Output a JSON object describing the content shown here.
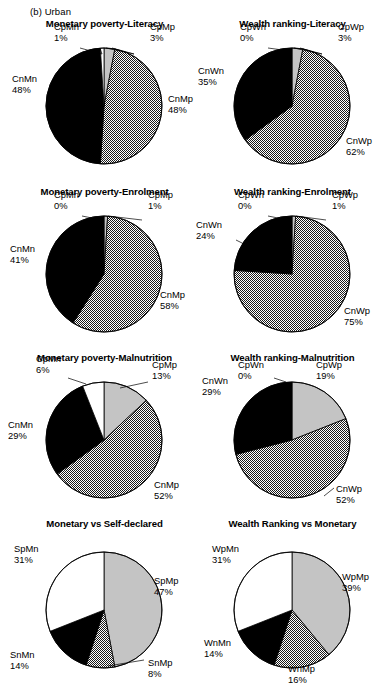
{
  "panel": {
    "label": "(b) Urban"
  },
  "chart_data": [
    {
      "type": "pie",
      "title": "Monetary poverty-Literacy",
      "grid": false,
      "legend": "none",
      "start_angle_deg": 0,
      "direction": "clockwise",
      "cx": 96,
      "cy": 88,
      "r": 58,
      "slices": [
        {
          "name": "CpMp",
          "value": 3,
          "label": "CpMp",
          "value_label": "3%",
          "fill": "gray",
          "lx": 142,
          "ly": 12,
          "anchor": "start",
          "leader": [
            [
              104,
              30
            ],
            [
              126,
              36
            ],
            [
              98,
              30
            ]
          ]
        },
        {
          "name": "CnMp",
          "value": 48,
          "label": "CnMp",
          "value_label": "48%",
          "fill": "dotted",
          "lx": 160,
          "ly": 84,
          "anchor": "start",
          "leader": null
        },
        {
          "name": "CnMn",
          "value": 48,
          "label": "CnMn",
          "value_label": "48%",
          "fill": "black",
          "lx": 4,
          "ly": 64,
          "anchor": "start",
          "leader": null
        },
        {
          "name": "CpMn",
          "value": 1,
          "label": "CpMn",
          "value_label": "1%",
          "fill": "white",
          "lx": 46,
          "ly": 12,
          "anchor": "start",
          "leader": [
            [
              72,
              30
            ],
            [
              94,
              36
            ],
            [
              92,
              30
            ]
          ]
        }
      ]
    },
    {
      "type": "pie",
      "title": "Wealth ranking-Literacy",
      "grid": false,
      "legend": "none",
      "start_angle_deg": 0,
      "direction": "clockwise",
      "cx": 96,
      "cy": 88,
      "r": 58,
      "slices": [
        {
          "name": "CpWp",
          "value": 3,
          "label": "CpWp",
          "value_label": "3%",
          "fill": "gray",
          "lx": 142,
          "ly": 12,
          "anchor": "start",
          "leader": [
            [
              104,
              30
            ],
            [
              126,
              36
            ],
            [
              98,
              30
            ]
          ]
        },
        {
          "name": "CnWp",
          "value": 62,
          "label": "CnWp",
          "value_label": "62%",
          "fill": "dotted",
          "lx": 150,
          "ly": 126,
          "anchor": "start",
          "leader": null
        },
        {
          "name": "CnWn",
          "value": 35,
          "label": "CnWn",
          "value_label": "35%",
          "fill": "black",
          "lx": 2,
          "ly": 56,
          "anchor": "start",
          "leader": [
            [
              44,
              68
            ],
            [
              56,
              74
            ]
          ]
        },
        {
          "name": "CpWn",
          "value": 0,
          "label": "CpWn",
          "value_label": "0%",
          "fill": "white",
          "lx": 44,
          "ly": 12,
          "anchor": "start",
          "leader": [
            [
              72,
              30
            ],
            [
              94,
              33
            ]
          ]
        }
      ]
    },
    {
      "type": "pie",
      "title": "Monetary poverty-Enrolment",
      "grid": false,
      "legend": "none",
      "start_angle_deg": 0,
      "direction": "clockwise",
      "cx": 96,
      "cy": 88,
      "r": 58,
      "slices": [
        {
          "name": "CpMp",
          "value": 1,
          "label": "CpMp",
          "value_label": "1%",
          "fill": "gray",
          "lx": 140,
          "ly": 12,
          "anchor": "start",
          "leader": [
            [
              100,
              30
            ],
            [
              134,
              34
            ]
          ]
        },
        {
          "name": "CnMp",
          "value": 58,
          "label": "CnMp",
          "value_label": "58%",
          "fill": "dotted",
          "lx": 152,
          "ly": 112,
          "anchor": "start",
          "leader": null
        },
        {
          "name": "CnMn",
          "value": 41,
          "label": "CnMn",
          "value_label": "41%",
          "fill": "black",
          "lx": 2,
          "ly": 66,
          "anchor": "start",
          "leader": null
        },
        {
          "name": "CpMn",
          "value": 0,
          "label": "CpMn",
          "value_label": "0%",
          "fill": "white",
          "lx": 46,
          "ly": 12,
          "anchor": "start",
          "leader": [
            [
              74,
              30
            ],
            [
              94,
              34
            ]
          ]
        }
      ]
    },
    {
      "type": "pie",
      "title": "Wealth ranking-Enrolment",
      "grid": false,
      "legend": "none",
      "start_angle_deg": 0,
      "direction": "clockwise",
      "cx": 96,
      "cy": 88,
      "r": 58,
      "slices": [
        {
          "name": "CpWp",
          "value": 1,
          "label": "CpWp",
          "value_label": "1%",
          "fill": "gray",
          "lx": 136,
          "ly": 12,
          "anchor": "start",
          "leader": [
            [
              100,
              30
            ],
            [
              130,
              34
            ]
          ]
        },
        {
          "name": "CnWp",
          "value": 75,
          "label": "CnWp",
          "value_label": "75%",
          "fill": "dotted",
          "lx": 148,
          "ly": 128,
          "anchor": "start",
          "leader": null
        },
        {
          "name": "CnWn",
          "value": 24,
          "label": "CnWn",
          "value_label": "24%",
          "fill": "black",
          "lx": 0,
          "ly": 42,
          "anchor": "start",
          "leader": [
            [
              40,
              54
            ],
            [
              52,
              60
            ]
          ]
        },
        {
          "name": "CpWn",
          "value": 0,
          "label": "CpWn",
          "value_label": "0%",
          "fill": "white",
          "lx": 42,
          "ly": 12,
          "anchor": "start",
          "leader": [
            [
              72,
              30
            ],
            [
              92,
              34
            ]
          ]
        }
      ]
    },
    {
      "type": "pie",
      "title": "Monetary poverty-Malnutrition",
      "grid": false,
      "legend": "none",
      "start_angle_deg": 0,
      "direction": "clockwise",
      "cx": 96,
      "cy": 88,
      "r": 58,
      "slices": [
        {
          "name": "CpMp",
          "value": 13,
          "label": "CpMp",
          "value_label": "13%",
          "fill": "gray",
          "lx": 144,
          "ly": 16,
          "anchor": "start",
          "leader": [
            [
              112,
              36
            ],
            [
              140,
              30
            ]
          ]
        },
        {
          "name": "CnMp",
          "value": 52,
          "label": "CnMp",
          "value_label": "52%",
          "fill": "dotted",
          "lx": 146,
          "ly": 136,
          "anchor": "start",
          "leader": null
        },
        {
          "name": "CnMn",
          "value": 29,
          "label": "CnMn",
          "value_label": "29%",
          "fill": "black",
          "lx": 0,
          "ly": 76,
          "anchor": "start",
          "leader": null
        },
        {
          "name": "CpMn",
          "value": 6,
          "label": "CpMn",
          "value_label": "6%",
          "fill": "white",
          "lx": 28,
          "ly": 10,
          "anchor": "start",
          "leader": [
            [
              78,
              32
            ],
            [
              60,
              26
            ]
          ]
        }
      ]
    },
    {
      "type": "pie",
      "title": "Wealth ranking-Malnutrition",
      "grid": false,
      "legend": "none",
      "start_angle_deg": 0,
      "direction": "clockwise",
      "cx": 96,
      "cy": 88,
      "r": 58,
      "slices": [
        {
          "name": "CpWp",
          "value": 19,
          "label": "CpWp",
          "value_label": "19%",
          "fill": "gray",
          "lx": 120,
          "ly": 16,
          "anchor": "start",
          "leader": null
        },
        {
          "name": "CnWp",
          "value": 52,
          "label": "CnWp",
          "value_label": "52%",
          "fill": "dotted",
          "lx": 140,
          "ly": 140,
          "anchor": "start",
          "leader": [
            [
              128,
              144
            ],
            [
              138,
              136
            ]
          ]
        },
        {
          "name": "CnWn",
          "value": 29,
          "label": "CnWn",
          "value_label": "29%",
          "fill": "black",
          "lx": 6,
          "ly": 32,
          "anchor": "start",
          "leader": null
        },
        {
          "name": "CpWn",
          "value": 0,
          "label": "CpWn",
          "value_label": "0%",
          "fill": "white",
          "lx": 42,
          "ly": 16,
          "anchor": "start",
          "leader": [
            [
              78,
              26
            ],
            [
              90,
              30
            ]
          ]
        }
      ]
    },
    {
      "type": "pie",
      "title": "Monetary vs Self-declared",
      "grid": false,
      "legend": "none",
      "start_angle_deg": 0,
      "direction": "clockwise",
      "cx": 96,
      "cy": 92,
      "r": 58,
      "slices": [
        {
          "name": "SpMp",
          "value": 47,
          "label": "SpMp",
          "value_label": "47%",
          "fill": "gray",
          "lx": 146,
          "ly": 66,
          "anchor": "start",
          "leader": null
        },
        {
          "name": "SnMp",
          "value": 8,
          "label": "SnMp",
          "value_label": "8%",
          "fill": "dotted",
          "lx": 140,
          "ly": 148,
          "anchor": "start",
          "leader": [
            [
              100,
              148
            ],
            [
              136,
              142
            ]
          ]
        },
        {
          "name": "SnMn",
          "value": 14,
          "label": "SnMn",
          "value_label": "14%",
          "fill": "black",
          "lx": 2,
          "ly": 140,
          "anchor": "start",
          "leader": null
        },
        {
          "name": "SpMn",
          "value": 31,
          "label": "SpMn",
          "value_label": "31%",
          "fill": "white",
          "lx": 6,
          "ly": 34,
          "anchor": "start",
          "leader": null
        }
      ]
    },
    {
      "type": "pie",
      "title": "Wealth Ranking vs Monetary",
      "grid": false,
      "legend": "none",
      "start_angle_deg": 0,
      "direction": "clockwise",
      "cx": 96,
      "cy": 92,
      "r": 58,
      "slices": [
        {
          "name": "WpMp",
          "value": 39,
          "label": "WpMp",
          "value_label": "39%",
          "fill": "gray",
          "lx": 146,
          "ly": 62,
          "anchor": "start",
          "leader": null
        },
        {
          "name": "WnMp",
          "value": 16,
          "label": "WnMp",
          "value_label": "16%",
          "fill": "dotted",
          "lx": 92,
          "ly": 154,
          "anchor": "start",
          "leader": null
        },
        {
          "name": "WnMn",
          "value": 14,
          "label": "WnMn",
          "value_label": "14%",
          "fill": "black",
          "lx": 8,
          "ly": 128,
          "anchor": "start",
          "leader": null
        },
        {
          "name": "WpMn",
          "value": 31,
          "label": "WpMn",
          "value_label": "31%",
          "fill": "white",
          "lx": 16,
          "ly": 34,
          "anchor": "start",
          "leader": null
        }
      ]
    }
  ],
  "layout": {
    "positions": [
      {
        "left": 8,
        "top": 18
      },
      {
        "left": 196,
        "top": 18
      },
      {
        "left": 8,
        "top": 186
      },
      {
        "left": 196,
        "top": 186
      },
      {
        "left": 8,
        "top": 352
      },
      {
        "left": 196,
        "top": 352
      },
      {
        "left": 8,
        "top": 518
      },
      {
        "left": 196,
        "top": 518
      }
    ]
  },
  "colors": {
    "gray_fill": "#c4c4c4",
    "black_fill": "#000000",
    "white_fill": "#ffffff",
    "stroke": "#000000"
  }
}
